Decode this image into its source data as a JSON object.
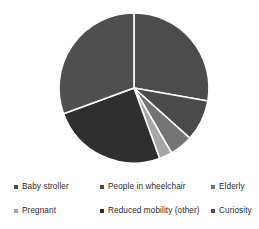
{
  "chart_data": {
    "type": "pie",
    "title": "",
    "categories": [
      "Baby stroller",
      "People in wheelchair",
      "Elderly",
      "Pregnant",
      "Reduced mobility (other)",
      "Curiosity"
    ],
    "values": [
      27.8,
      8.9,
      5.0,
      2.8,
      25.0,
      30.5
    ],
    "units": "percent",
    "legend_position": "bottom",
    "grid": false,
    "start_angle_deg": 0,
    "direction": "clockwise",
    "slices": [
      {
        "label": "Baby stroller",
        "value": 27.8,
        "color": "#4c4c4c",
        "start_deg": 0.0,
        "end_deg": 100.0
      },
      {
        "label": "People in wheelchair",
        "value": 8.9,
        "color": "#4a4a4a",
        "start_deg": 100.0,
        "end_deg": 132.0
      },
      {
        "label": "Elderly",
        "value": 5.0,
        "color": "#747474",
        "start_deg": 132.0,
        "end_deg": 150.0
      },
      {
        "label": "Pregnant",
        "value": 2.8,
        "color": "#a6a6a6",
        "start_deg": 150.0,
        "end_deg": 160.0
      },
      {
        "label": "Reduced mobility (other)",
        "value": 25.0,
        "color": "#2f2f2f",
        "start_deg": 160.0,
        "end_deg": 250.0
      },
      {
        "label": "Curiosity",
        "value": 30.5,
        "color": "#4f4f4f",
        "start_deg": 250.0,
        "end_deg": 360.0
      }
    ],
    "geometry": {
      "center_x": 134,
      "center_y": 88,
      "radius": 75,
      "separator_color": "#ffffff",
      "separator_width": 1.6
    }
  },
  "legend": {
    "rows": [
      [
        {
          "label": "Baby stroller",
          "color": "#4c4c4c"
        },
        {
          "label": "People in wheelchair",
          "color": "#4a4a4a"
        },
        {
          "label": "Elderly",
          "color": "#747474"
        }
      ],
      [
        {
          "label": "Pregnant",
          "color": "#a6a6a6"
        },
        {
          "label": "Reduced mobility (other)",
          "color": "#2f2f2f"
        },
        {
          "label": "Curiosity",
          "color": "#4f4f4f"
        }
      ]
    ]
  },
  "canvas": {
    "background": "#ffffff"
  }
}
